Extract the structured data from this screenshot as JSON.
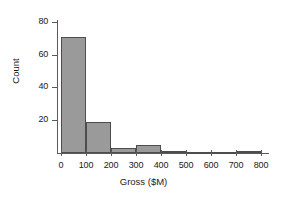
{
  "chart_data": {
    "type": "bar",
    "title": "",
    "subtitle": "",
    "xlabel": "Gross ($M)",
    "ylabel": "Count",
    "categories": [
      "0–100",
      "100–200",
      "200–300",
      "300–400",
      "400–500",
      "500–600",
      "600–700",
      "700–800"
    ],
    "bin_edges": [
      0,
      100,
      200,
      300,
      400,
      500,
      600,
      700,
      800
    ],
    "values": [
      71,
      19,
      3,
      5,
      1,
      0,
      0,
      1
    ],
    "bin_width": 100,
    "xlim": [
      0,
      800
    ],
    "ylim": [
      0,
      84
    ],
    "xticks": [
      0,
      100,
      200,
      300,
      400,
      500,
      600,
      700,
      800
    ],
    "yticks": [
      20,
      40,
      60,
      80
    ],
    "xtick_labels": [
      "0",
      "100",
      "200",
      "300",
      "400",
      "500",
      "600",
      "700",
      "800"
    ],
    "ytick_labels": [
      "20",
      "40",
      "60",
      "80"
    ],
    "grid": false,
    "legend": null,
    "bar_fill_color": "#9a9a9a",
    "bar_edge_color": "#4d4d4d",
    "axis_color": "#5a5a5a",
    "background_color": "#ffffff"
  }
}
